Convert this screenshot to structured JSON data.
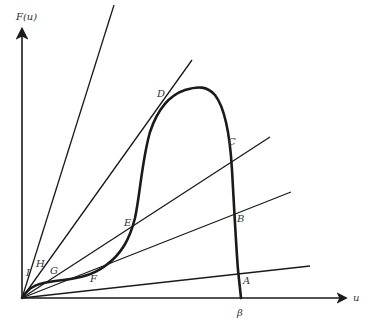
{
  "axes": {
    "y_label": "F(u)",
    "x_label": "u",
    "x_tick_label": "β"
  },
  "points": {
    "A": "A",
    "B": "B",
    "C": "C",
    "D": "D",
    "E": "E",
    "F": "F",
    "G": "G",
    "H": "H",
    "I": "I"
  },
  "geometry": {
    "origin": [
      22,
      298
    ],
    "rays_end": [
      [
        114,
        5
      ],
      [
        192,
        60
      ],
      [
        270,
        137
      ],
      [
        291,
        192
      ],
      [
        310,
        266
      ]
    ],
    "curve_points": [
      "I",
      "H",
      "G",
      "F",
      "E",
      "D",
      "peak",
      "C",
      "B",
      "A",
      "β"
    ]
  },
  "colors": {
    "line": "#1a1a1a",
    "text": "#333333",
    "background": "#ffffff"
  }
}
